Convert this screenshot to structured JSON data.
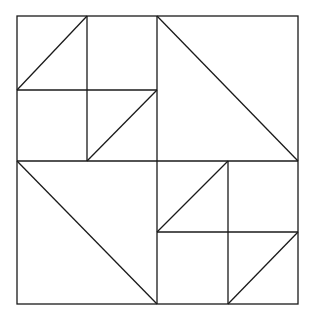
{
  "diagram": {
    "type": "geometric-quilt-pattern",
    "stroke_color": "#1a1a1a",
    "background": "#ffffff",
    "outer_square": {
      "x1": 17,
      "y1": 16,
      "x2": 298,
      "y2": 304
    },
    "center": {
      "x": 157,
      "y": 161
    },
    "quadrants": {
      "top_left": {
        "subdivided": true,
        "divider_x": 87,
        "divider_y": 90,
        "diagonals": [
          {
            "from": [
              17,
              90
            ],
            "to": [
              87,
              16
            ]
          },
          {
            "from": [
              87,
              161
            ],
            "to": [
              157,
              90
            ]
          }
        ]
      },
      "top_right": {
        "subdivided": false,
        "diagonals": [
          {
            "from": [
              157,
              16
            ],
            "to": [
              298,
              161
            ]
          }
        ]
      },
      "bottom_left": {
        "subdivided": false,
        "diagonals": [
          {
            "from": [
              17,
              161
            ],
            "to": [
              157,
              304
            ]
          }
        ]
      },
      "bottom_right": {
        "subdivided": true,
        "divider_x": 228,
        "divider_y": 232,
        "diagonals": [
          {
            "from": [
              157,
              232
            ],
            "to": [
              228,
              161
            ]
          },
          {
            "from": [
              228,
              304
            ],
            "to": [
              298,
              232
            ]
          }
        ]
      }
    },
    "lines": [
      {
        "name": "center-vertical-line",
        "x1": 157,
        "y1": 16,
        "x2": 157,
        "y2": 304
      },
      {
        "name": "center-horizontal-line",
        "x1": 17,
        "y1": 161,
        "x2": 298,
        "y2": 161
      },
      {
        "name": "top-left-quadrant-vertical-divider",
        "x1": 87,
        "y1": 16,
        "x2": 87,
        "y2": 161
      },
      {
        "name": "top-left-quadrant-horizontal-divider",
        "x1": 17,
        "y1": 90,
        "x2": 157,
        "y2": 90
      },
      {
        "name": "top-left-upper-diagonal",
        "x1": 17,
        "y1": 90,
        "x2": 87,
        "y2": 16
      },
      {
        "name": "top-left-lower-diagonal",
        "x1": 87,
        "y1": 161,
        "x2": 157,
        "y2": 90
      },
      {
        "name": "top-right-quadrant-diagonal",
        "x1": 157,
        "y1": 16,
        "x2": 298,
        "y2": 161
      },
      {
        "name": "bottom-left-quadrant-diagonal",
        "x1": 17,
        "y1": 161,
        "x2": 157,
        "y2": 304
      },
      {
        "name": "bottom-right-quadrant-vertical-divider",
        "x1": 228,
        "y1": 161,
        "x2": 228,
        "y2": 304
      },
      {
        "name": "bottom-right-quadrant-horizontal-divider",
        "x1": 157,
        "y1": 232,
        "x2": 298,
        "y2": 232
      },
      {
        "name": "bottom-right-upper-diagonal",
        "x1": 157,
        "y1": 232,
        "x2": 228,
        "y2": 161
      },
      {
        "name": "bottom-right-lower-diagonal",
        "x1": 228,
        "y1": 304,
        "x2": 298,
        "y2": 232
      }
    ]
  }
}
